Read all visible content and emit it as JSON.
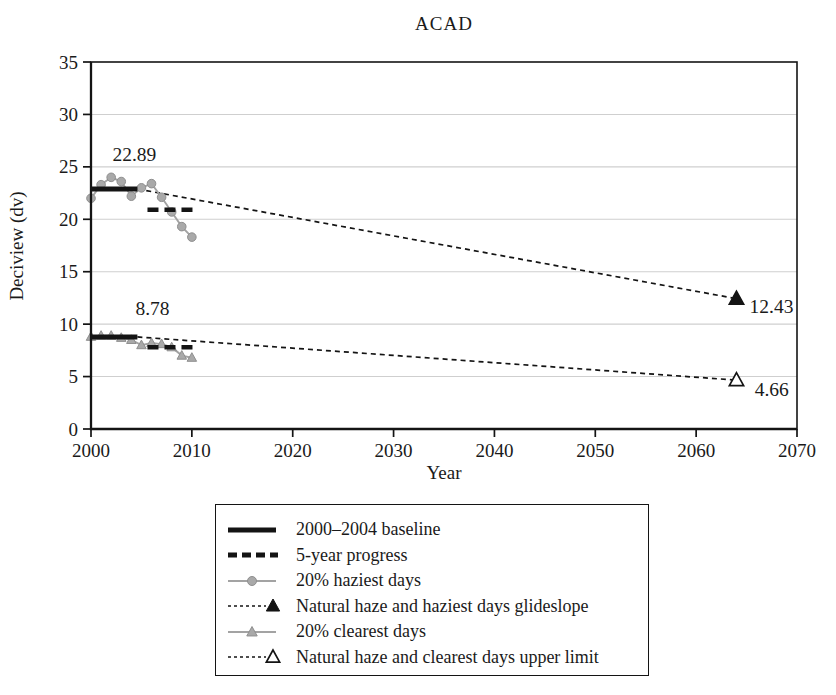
{
  "chart_data": {
    "type": "line",
    "title": "ACAD",
    "xlabel": "Year",
    "ylabel": "Deciview (dv)",
    "xlim": [
      2000,
      2070
    ],
    "ylim": [
      0,
      35
    ],
    "x_ticks": [
      2000,
      2010,
      2020,
      2030,
      2040,
      2050,
      2060,
      2070
    ],
    "y_ticks": [
      0,
      5,
      10,
      15,
      20,
      25,
      30,
      35
    ],
    "grid": "horizontal-only",
    "legend_position": "below-plot",
    "series": [
      {
        "name": "20% haziest days",
        "marker": "circle",
        "x": [
          2000,
          2001,
          2002,
          2003,
          2004,
          2005,
          2006,
          2007,
          2008,
          2009,
          2010
        ],
        "y": [
          22.0,
          23.3,
          24.0,
          23.6,
          22.2,
          23.0,
          23.4,
          22.1,
          20.7,
          19.3,
          18.3
        ]
      },
      {
        "name": "20% clearest days",
        "marker": "triangle",
        "x": [
          2000,
          2001,
          2002,
          2003,
          2004,
          2005,
          2006,
          2007,
          2008,
          2009,
          2010
        ],
        "y": [
          8.8,
          8.9,
          8.9,
          8.7,
          8.5,
          8.0,
          8.2,
          8.1,
          7.8,
          7.0,
          6.8
        ]
      }
    ],
    "baselines": [
      {
        "name": "2000-2004 baseline haziest",
        "value": 22.89,
        "x_start": 2000,
        "x_end": 2004.6
      },
      {
        "name": "2000-2004 baseline clearest",
        "value": 8.78,
        "x_start": 2000,
        "x_end": 2004.6
      }
    ],
    "progress_segments": [
      {
        "name": "5-year progress haziest",
        "value": 20.9,
        "x_start": 2005.6,
        "x_end": 2010.2
      },
      {
        "name": "5-year progress clearest",
        "value": 7.8,
        "x_start": 2005.6,
        "x_end": 2010.2
      }
    ],
    "glideslopes": [
      {
        "name": "Natural haze and haziest days glideslope",
        "x_start": 2004.6,
        "y_start": 22.89,
        "x_end": 2064,
        "y_end": 12.43,
        "end_marker": "filled-triangle"
      },
      {
        "name": "Natural haze and clearest days upper limit",
        "x_start": 2004.6,
        "y_start": 8.78,
        "x_end": 2064,
        "y_end": 4.66,
        "end_marker": "open-triangle"
      }
    ],
    "annotations": [
      {
        "text": "22.89",
        "x": 2004.3,
        "y": 25.6,
        "anchor": "middle"
      },
      {
        "text": "8.78",
        "x": 2006.1,
        "y": 10.9,
        "anchor": "middle"
      },
      {
        "text": "12.43",
        "x": 2065.3,
        "y": 11.1,
        "anchor": "start"
      },
      {
        "text": "4.66",
        "x": 2065.8,
        "y": 3.1,
        "anchor": "start"
      }
    ]
  },
  "legend": {
    "items": [
      {
        "label": "2000–2004 baseline",
        "swatch": "thick-solid-line",
        "icon": "baseline-swatch-icon"
      },
      {
        "label": "5-year progress",
        "swatch": "thick-dashed-line",
        "icon": "progress-swatch-icon"
      },
      {
        "label": "20% haziest days",
        "swatch": "gray-line-circle",
        "icon": "haziest-days-swatch-icon"
      },
      {
        "label": "Natural haze and haziest days glideslope",
        "swatch": "dotted-line-filled-triangle",
        "icon": "haziest-glideslope-swatch-icon"
      },
      {
        "label": "20% clearest days",
        "swatch": "gray-line-triangle",
        "icon": "clearest-days-swatch-icon"
      },
      {
        "label": "Natural haze and clearest days upper limit",
        "swatch": "dotted-line-open-triangle",
        "icon": "clearest-upper-limit-swatch-icon"
      }
    ]
  },
  "colors": {
    "series_gray": "#a9a9a9",
    "series_gray_edge": "#8f8f8f",
    "series_gray_line": "#a3a3a3",
    "black_line": "#141414",
    "grid": "#cfcfcf",
    "text": "#1a1a1a",
    "background": "#ffffff"
  }
}
